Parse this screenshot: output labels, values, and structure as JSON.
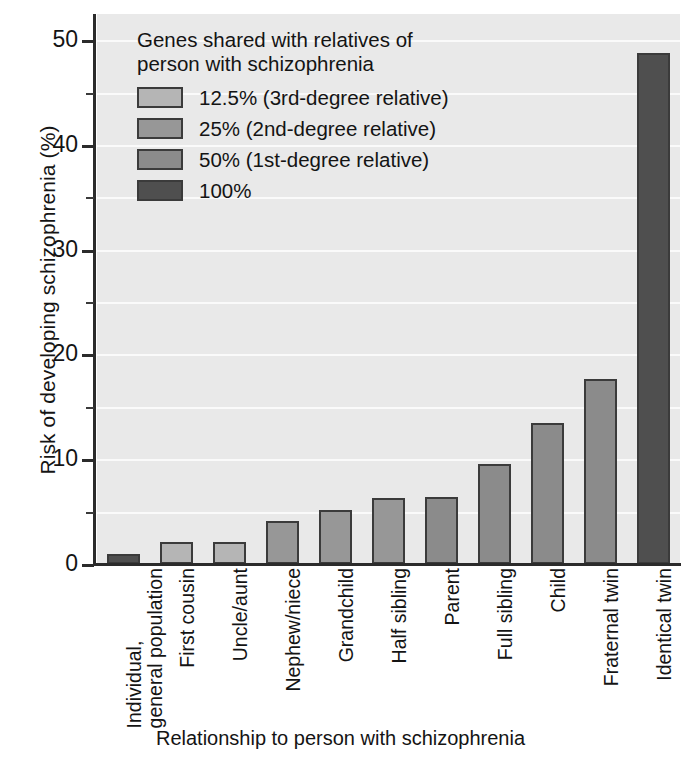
{
  "chart_data": {
    "type": "bar",
    "title": "",
    "xlabel": "Relationship to person with schizophrenia",
    "ylabel": "Risk of developing schizophrenia (%)",
    "categories": [
      "Individual, general population",
      "First cousin",
      "Uncle/aunt",
      "Nephew/niece",
      "Grandchild",
      "Half sibling",
      "Parent",
      "Full sibling",
      "Child",
      "Fraternal twin",
      "Identical twin"
    ],
    "category_lines": [
      [
        "Individual,",
        "general population"
      ],
      [
        "First cousin"
      ],
      [
        "Uncle/aunt"
      ],
      [
        "Nephew/niece"
      ],
      [
        "Grandchild"
      ],
      [
        "Half sibling"
      ],
      [
        "Parent"
      ],
      [
        "Full sibling"
      ],
      [
        "Child"
      ],
      [
        "Fraternal twin"
      ],
      [
        "Identical twin"
      ]
    ],
    "values": [
      1.0,
      2.1,
      2.1,
      4.1,
      5.2,
      6.3,
      6.4,
      9.5,
      13.5,
      17.7,
      48.8
    ],
    "group_index": [
      3,
      0,
      0,
      1,
      1,
      1,
      2,
      2,
      2,
      2,
      3
    ],
    "ylim": [
      0,
      52.5
    ],
    "yticks": [
      0,
      10,
      20,
      30,
      40,
      50
    ],
    "yticks_minor": [
      5,
      15,
      25,
      35,
      45
    ],
    "ytick_labels": [
      "0",
      "10",
      "20",
      "30",
      "40",
      "50"
    ],
    "grid": "horizontal-minor-white",
    "legend_position": "upper-left-inside"
  },
  "legend": {
    "title": "Genes shared with relatives of\nperson with schizophrenia",
    "items": [
      {
        "label": "12.5% (3rd-degree relative)",
        "color": "#b5b5b5"
      },
      {
        "label": "25% (2nd-degree relative)",
        "color": "#979797"
      },
      {
        "label": "50% (1st-degree relative)",
        "color": "#8b8b8b"
      },
      {
        "label": "100%",
        "color": "#4f4f4f"
      }
    ]
  },
  "colors": {
    "plot_background": "#e9e9e9",
    "gridline": "#fafafa",
    "axis": "#2b2b2b",
    "bar_outline": "#3b3b3b",
    "text": "#141414",
    "group_12_5": "#b5b5b5",
    "group_25": "#979797",
    "group_50": "#8b8b8b",
    "group_100": "#4f4f4f"
  }
}
